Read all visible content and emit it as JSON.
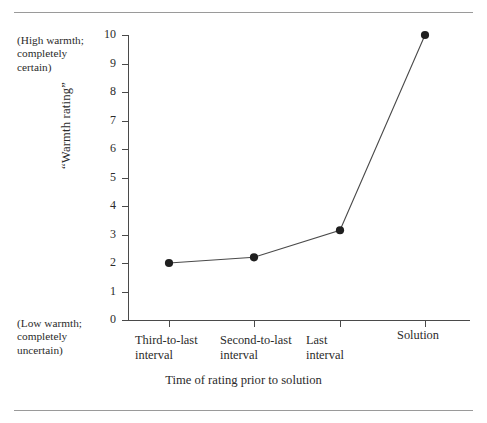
{
  "figure": {
    "top_rule": true,
    "bottom_rule": true
  },
  "annotations": {
    "high": "(High warmth;\ncompletely\ncertain)",
    "low": "(Low warmth;\ncompletely\nuncertain)"
  },
  "chart_data": {
    "type": "line",
    "title": "",
    "xlabel": "Time of rating prior to solution",
    "ylabel": "“Warmth rating”",
    "categories": [
      "Third-to-last\ninterval",
      "Second-to-last\ninterval",
      "Last\ninterval",
      "Solution"
    ],
    "values": [
      2.0,
      2.2,
      3.15,
      10.0
    ],
    "ylim": [
      0,
      10
    ],
    "yticks": [
      0,
      1,
      2,
      3,
      4,
      5,
      6,
      7,
      8,
      9,
      10
    ],
    "ytick_labels": [
      "0",
      "1",
      "2",
      "3",
      "4",
      "5",
      "6",
      "7",
      "8",
      "9",
      "10"
    ],
    "grid": false,
    "legend": false,
    "marker": "filled-circle",
    "line_color": "#4a4a4a",
    "marker_color": "#1f1f1f",
    "axis_color": "#4a4a4a"
  }
}
